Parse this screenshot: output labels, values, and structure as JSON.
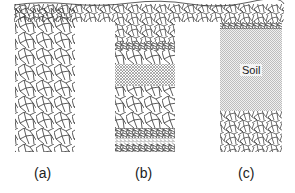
{
  "diagram": {
    "panels": [
      {
        "label": "(a)",
        "description": "coarse rock fill throughout"
      },
      {
        "label": "(b)",
        "description": "layered: coarse rock, fine gravel, coarse rock, fine gravel, sand"
      },
      {
        "label": "(c)",
        "description": "soil layer over coarse rock base",
        "inner_label": "Soil"
      }
    ],
    "colors": {
      "line": "#333333",
      "soil_fill": "#d8d8d8",
      "background": "#ffffff"
    }
  }
}
